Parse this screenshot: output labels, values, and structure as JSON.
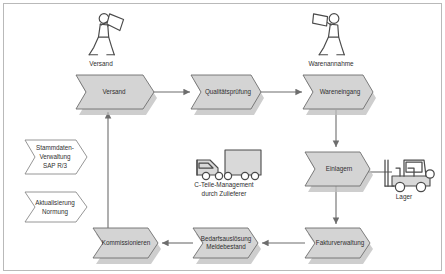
{
  "diagram": {
    "colors": {
      "process_fill": "#d4d4d4",
      "process_stroke": "#6e6e6e",
      "open_fill": "#ffffff",
      "connector": "#6d6d6d",
      "frame": "#b9b9b9",
      "icon_stroke": "#4a4a4a",
      "label_text": "#2f2f2f"
    },
    "process_nodes": [
      {
        "id": "versand",
        "label": "Versand",
        "label2": "",
        "x": 112,
        "y": 92,
        "w": 78,
        "h": 34,
        "style": "filled"
      },
      {
        "id": "qualitaetspruefung",
        "label": "Qualitätsprüfung",
        "label2": "",
        "x": 224,
        "y": 92,
        "w": 68,
        "h": 34,
        "style": "filled"
      },
      {
        "id": "wareneingang",
        "label": "Wareneingang",
        "label2": "",
        "x": 336,
        "y": 92,
        "w": 68,
        "h": 34,
        "style": "filled"
      },
      {
        "id": "einlagern",
        "label": "Einlagern",
        "label2": "",
        "x": 336,
        "y": 167,
        "w": 62,
        "h": 32,
        "style": "filled"
      },
      {
        "id": "fakturverwaltung",
        "label": "Fakturverwaltung",
        "label2": "",
        "x": 336,
        "y": 243,
        "w": 62,
        "h": 30,
        "style": "filled"
      },
      {
        "id": "bedarfsausloesung",
        "label": "Bedarfsauslösung",
        "label2": "Meldebestand",
        "x": 224,
        "y": 243,
        "w": 62,
        "h": 30,
        "style": "filled"
      },
      {
        "id": "kommissionieren",
        "label": "Kommissionieren",
        "label2": "",
        "x": 124,
        "y": 243,
        "w": 62,
        "h": 30,
        "style": "filled"
      }
    ],
    "open_nodes": [
      {
        "id": "stammdaten",
        "label": "Stammdaten-",
        "label2": "Verwaltung",
        "label3": "SAP R/3",
        "x": 55,
        "y": 155,
        "w": 62,
        "h": 28
      },
      {
        "id": "aktualisierung",
        "label": "Aktualisierung",
        "label2": "Normung",
        "label3": "",
        "x": 55,
        "y": 206,
        "w": 62,
        "h": 24
      }
    ],
    "icons": [
      {
        "id": "versand-person",
        "icon": "person-carrying-box-icon",
        "label": "Versand",
        "x": 101,
        "y": 34,
        "label_y": 63
      },
      {
        "id": "warenannahme-person",
        "icon": "person-carrying-box-icon",
        "label": "Warenannahme",
        "x": 331,
        "y": 34,
        "label_y": 63
      },
      {
        "id": "truck",
        "icon": "delivery-truck-icon",
        "label": "C-Teile-Management",
        "label2": "durch Zulieferer",
        "x": 224,
        "y": 163,
        "label_y": 184
      },
      {
        "id": "forklift",
        "icon": "forklift-icon",
        "label": "Lager",
        "x": 405,
        "y": 170,
        "label_y": 196
      }
    ],
    "connectors": [
      {
        "id": "versand-to-qualitaetspruefung",
        "from": "versand",
        "to": "qualitaetspruefung",
        "direction": "right"
      },
      {
        "id": "qualitaetspruefung-to-wareneingang",
        "from": "qualitaetspruefung",
        "to": "wareneingang",
        "direction": "right"
      },
      {
        "id": "wareneingang-to-einlagern",
        "from": "wareneingang",
        "to": "einlagern",
        "direction": "down"
      },
      {
        "id": "einlagern-to-fakturverwaltung",
        "from": "einlagern",
        "to": "fakturverwaltung",
        "direction": "down"
      },
      {
        "id": "fakturverwaltung-to-bedarfsausloesung",
        "from": "fakturverwaltung",
        "to": "bedarfsausloesung",
        "direction": "left"
      },
      {
        "id": "bedarfsausloesung-to-kommissionieren",
        "from": "bedarfsausloesung",
        "to": "kommissionieren",
        "direction": "left"
      },
      {
        "id": "kommissionieren-to-versand",
        "from": "kommissionieren",
        "to": "versand",
        "direction": "up"
      },
      {
        "id": "einlagern-to-forklift",
        "from": "einlagern",
        "to": "forklift",
        "direction": "right-plain"
      }
    ]
  }
}
